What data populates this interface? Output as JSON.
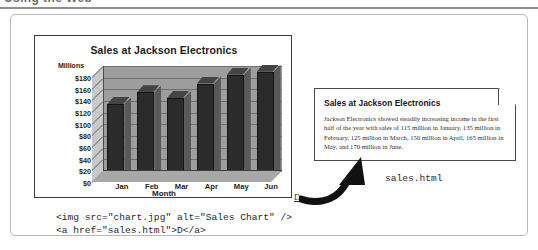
{
  "page": {
    "top_heading": "Using the Web"
  },
  "chart_figure": {
    "title": "Sales at Jackson Electronics",
    "y_axis_label": "Millions",
    "x_axis_label": "Month"
  },
  "chart_data": {
    "type": "bar",
    "title": "Sales at Jackson Electronics",
    "xlabel": "Month",
    "ylabel": "Millions",
    "categories": [
      "Jan",
      "Feb",
      "Mar",
      "Apr",
      "May",
      "Jun"
    ],
    "values": [
      115,
      135,
      125,
      150,
      165,
      170
    ],
    "ylim": [
      0,
      180
    ],
    "ytick_labels": [
      "$180",
      "$160",
      "$140",
      "$120",
      "$100",
      "$80",
      "$60",
      "$40",
      "$20",
      "$0"
    ],
    "ytick_values": [
      180,
      160,
      140,
      120,
      100,
      80,
      60,
      40,
      20,
      0
    ],
    "grid": true,
    "legend": "none",
    "style": "3d-column",
    "bar_color": "#2b2b2b",
    "plot_background": "#9d9d9d"
  },
  "link_marker": {
    "label": "D"
  },
  "code": {
    "line1": "<img src=\"chart.jpg\" alt=\"Sales Chart\" />",
    "line2": "<a href=\"sales.html\">D</a>"
  },
  "note": {
    "title": "Sales at Jackson Electronics",
    "body": "Jackson Electronics showed steadily increasing income in the first half of the year with sales of 115 million in January, 135 million in February, 125 million in March, 150 million in April, 165 million in May, and 170 million in June."
  },
  "caption": {
    "filename": "sales.html"
  }
}
